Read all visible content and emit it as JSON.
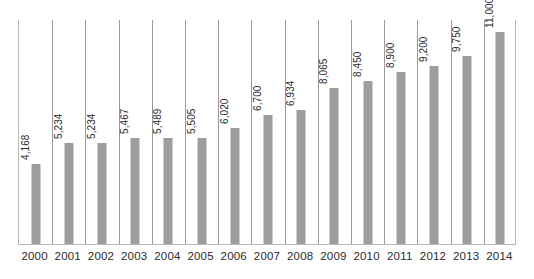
{
  "chart_data": {
    "type": "bar",
    "title": "",
    "subtitle": "",
    "xlabel": "",
    "ylabel": "",
    "grid": "vertical-category-separators",
    "legend": "none",
    "ylim": [
      0,
      11600
    ],
    "categories": [
      "2000",
      "2001",
      "2002",
      "2003",
      "2004",
      "2005",
      "2006",
      "2007",
      "2008",
      "2009",
      "2010",
      "2011",
      "2012",
      "2013",
      "2014"
    ],
    "values": [
      4168,
      5234,
      5234,
      5467,
      5489,
      5505,
      6020,
      6700,
      6934,
      8065,
      8450,
      8900,
      9200,
      9750,
      11000
    ],
    "value_labels": [
      "4,168",
      "5,234",
      "5,234",
      "5,467",
      "5,489",
      "5,505",
      "6,020",
      "6,700",
      "6,934",
      "8,065",
      "8,450",
      "8,900",
      "9,200",
      "9,750",
      "11,000"
    ],
    "label_rotation": -90,
    "label_position": "outside-end"
  },
  "style": {
    "bar_color": "#9d9d9d",
    "gridline_color": "#9a9a9a",
    "axis_color": "#b9b9b9",
    "text_color": "#2b2b2b",
    "background": "#ffffff"
  }
}
